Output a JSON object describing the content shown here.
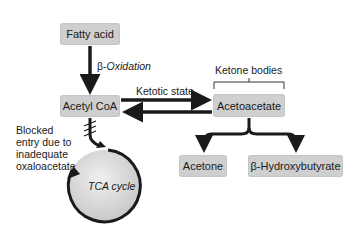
{
  "nodes": {
    "fatty_acid": "Fatty acid",
    "acetyl_coa": "Acetyl CoA",
    "acetoacetate": "Acetoacetate",
    "acetone": "Acetone",
    "hydroxybutyrate": "β-Hydroxybutyrate",
    "tca_cycle": "TCA cycle"
  },
  "labels": {
    "beta_oxidation": "β-Oxidation",
    "ketotic_state": "Ketotic state",
    "ketone_bodies": "Ketone bodies",
    "blocked_1": "Blocked",
    "blocked_2": "entry due to",
    "blocked_3": "inadequate",
    "blocked_4": "oxaloacetate"
  },
  "colors": {
    "box": "#cfcfcf",
    "arrow": "#1a1a1a",
    "circle": "#dcdcdc"
  }
}
